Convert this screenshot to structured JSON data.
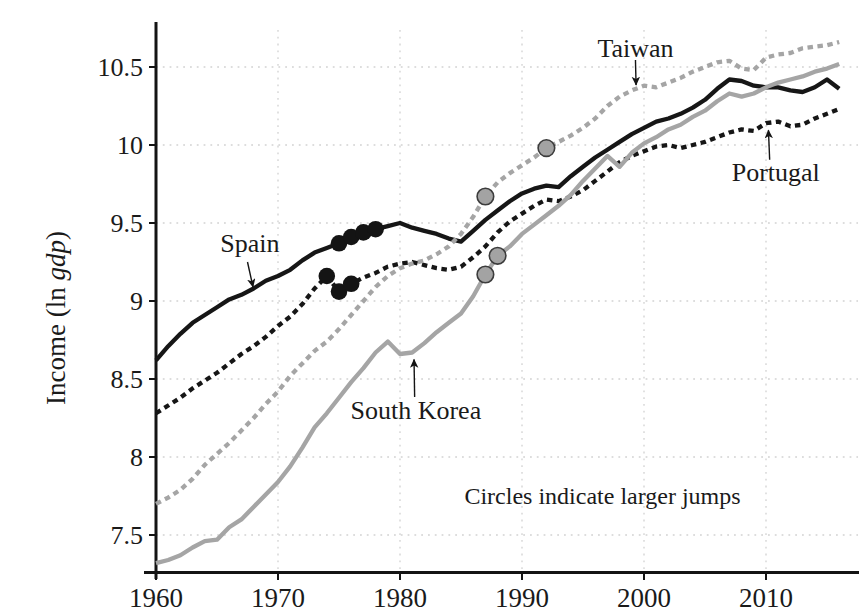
{
  "chart_data": {
    "type": "line",
    "title": "",
    "xlabel": "",
    "ylabel": "Income (ln gdp)",
    "ylabel_parts": [
      {
        "text": "Income (ln ",
        "italic": false
      },
      {
        "text": "gdp",
        "italic": true
      },
      {
        "text": ")",
        "italic": false
      }
    ],
    "note": "Circles indicate larger jumps",
    "x_tick_labels": [
      "1960",
      "1970",
      "1980",
      "1990",
      "2000",
      "2010"
    ],
    "x_tick_values": [
      1960,
      1970,
      1980,
      1990,
      2000,
      2010
    ],
    "y_tick_labels": [
      "7.5",
      "8",
      "8.5",
      "9",
      "9.5",
      "10",
      "10.5"
    ],
    "y_tick_values": [
      7.5,
      8,
      8.5,
      9,
      9.5,
      10,
      10.5
    ],
    "xlim": [
      1960,
      2017.5
    ],
    "ylim": [
      7.25,
      10.76
    ],
    "grid": "dotted",
    "legend_position": "inline-annotations",
    "colors": {
      "black": "#161616",
      "gray": "#a5a5a5",
      "gray_marker_fill": "#a3a3a3",
      "gray_marker_edge": "#3c3c3c",
      "black_marker_fill": "#141414",
      "grid": "#d2d2d2",
      "axis": "#141414",
      "background": "#ffffff"
    },
    "years": [
      1960,
      1961,
      1962,
      1963,
      1964,
      1965,
      1966,
      1967,
      1968,
      1969,
      1970,
      1971,
      1972,
      1973,
      1974,
      1975,
      1976,
      1977,
      1978,
      1979,
      1980,
      1981,
      1982,
      1983,
      1984,
      1985,
      1986,
      1987,
      1988,
      1989,
      1990,
      1991,
      1992,
      1993,
      1994,
      1995,
      1996,
      1997,
      1998,
      1999,
      2000,
      2001,
      2002,
      2003,
      2004,
      2005,
      2006,
      2007,
      2008,
      2009,
      2010,
      2011,
      2012,
      2013,
      2014,
      2015,
      2016
    ],
    "series": [
      {
        "name": "Spain",
        "line": "solid",
        "color_key": "black",
        "jump_years": [
          1975,
          1976,
          1977,
          1978
        ],
        "values": [
          8.62,
          8.71,
          8.79,
          8.86,
          8.91,
          8.96,
          9.01,
          9.04,
          9.08,
          9.13,
          9.16,
          9.2,
          9.26,
          9.31,
          9.34,
          9.37,
          9.41,
          9.44,
          9.46,
          9.48,
          9.5,
          9.47,
          9.45,
          9.43,
          9.4,
          9.38,
          9.45,
          9.52,
          9.58,
          9.64,
          9.69,
          9.72,
          9.74,
          9.73,
          9.8,
          9.86,
          9.92,
          9.97,
          10.02,
          10.07,
          10.11,
          10.15,
          10.17,
          10.2,
          10.24,
          10.29,
          10.36,
          10.42,
          10.41,
          10.38,
          10.37,
          10.37,
          10.35,
          10.34,
          10.37,
          10.42,
          10.36
        ]
      },
      {
        "name": "Portugal",
        "line": "dashed",
        "color_key": "black",
        "jump_years": [
          1974,
          1975,
          1976
        ],
        "values": [
          8.28,
          8.33,
          8.38,
          8.44,
          8.49,
          8.54,
          8.6,
          8.66,
          8.71,
          8.77,
          8.84,
          8.9,
          8.98,
          9.08,
          9.16,
          9.06,
          9.11,
          9.15,
          9.18,
          9.22,
          9.24,
          9.25,
          9.23,
          9.21,
          9.2,
          9.22,
          9.28,
          9.35,
          9.44,
          9.51,
          9.56,
          9.61,
          9.65,
          9.64,
          9.67,
          9.71,
          9.77,
          9.83,
          9.89,
          9.93,
          9.96,
          9.99,
          10.0,
          9.98,
          10.0,
          10.02,
          10.05,
          10.08,
          10.1,
          10.09,
          10.14,
          10.15,
          10.12,
          10.13,
          10.17,
          10.2,
          10.23
        ]
      },
      {
        "name": "Taiwan",
        "line": "dashed",
        "color_key": "gray",
        "jump_years": [
          1987,
          1992
        ],
        "values": [
          7.7,
          7.74,
          7.79,
          7.86,
          7.95,
          8.02,
          8.09,
          8.17,
          8.25,
          8.34,
          8.42,
          8.52,
          8.6,
          8.68,
          8.74,
          8.82,
          8.91,
          9.0,
          9.09,
          9.16,
          9.21,
          9.24,
          9.26,
          9.3,
          9.35,
          9.43,
          9.54,
          9.67,
          9.76,
          9.82,
          9.87,
          9.92,
          9.98,
          10.02,
          10.06,
          10.11,
          10.17,
          10.25,
          10.31,
          10.35,
          10.38,
          10.37,
          10.4,
          10.43,
          10.47,
          10.5,
          10.53,
          10.54,
          10.49,
          10.48,
          10.56,
          10.58,
          10.59,
          10.62,
          10.63,
          10.64,
          10.66
        ]
      },
      {
        "name": "South Korea",
        "line": "solid",
        "color_key": "gray",
        "jump_years": [
          1987,
          1988
        ],
        "values": [
          7.32,
          7.34,
          7.37,
          7.42,
          7.46,
          7.47,
          7.55,
          7.6,
          7.68,
          7.76,
          7.84,
          7.94,
          8.06,
          8.19,
          8.28,
          8.38,
          8.48,
          8.57,
          8.67,
          8.74,
          8.66,
          8.67,
          8.73,
          8.8,
          8.86,
          8.92,
          9.03,
          9.17,
          9.29,
          9.35,
          9.43,
          9.49,
          9.55,
          9.61,
          9.68,
          9.77,
          9.85,
          9.93,
          9.86,
          9.95,
          10.01,
          10.05,
          10.1,
          10.13,
          10.18,
          10.22,
          10.28,
          10.33,
          10.31,
          10.33,
          10.37,
          10.4,
          10.42,
          10.44,
          10.47,
          10.49,
          10.52
        ]
      }
    ],
    "annotations": [
      {
        "id": "spain-label",
        "text": "Spain",
        "year": 1967.7,
        "value": 9.37,
        "arrow": {
          "from": {
            "year": 1967.5,
            "value": 9.25
          },
          "to": {
            "year": 1967.95,
            "value": 9.09
          }
        }
      },
      {
        "id": "taiwan-label",
        "text": "Taiwan",
        "year": 1999.3,
        "value": 10.62,
        "arrow": {
          "from": {
            "year": 1999.3,
            "value": 10.545
          },
          "to": {
            "year": 1999.35,
            "value": 10.385
          }
        }
      },
      {
        "id": "portugal-label",
        "text": "Portugal",
        "year": 2010.8,
        "value": 9.83,
        "arrow": {
          "from": {
            "year": 2010.3,
            "value": 9.905
          },
          "to": {
            "year": 2010.2,
            "value": 10.095
          }
        }
      },
      {
        "id": "south-korea-label",
        "text": "South Korea",
        "year": 1981.3,
        "value": 8.3,
        "arrow": {
          "from": {
            "year": 1981.2,
            "value": 8.385
          },
          "to": {
            "year": 1981.15,
            "value": 8.625
          }
        }
      },
      {
        "id": "jumps-note",
        "text": "Circles indicate larger jumps",
        "year": 1996.6,
        "value": 7.75,
        "arrow": null
      }
    ]
  }
}
